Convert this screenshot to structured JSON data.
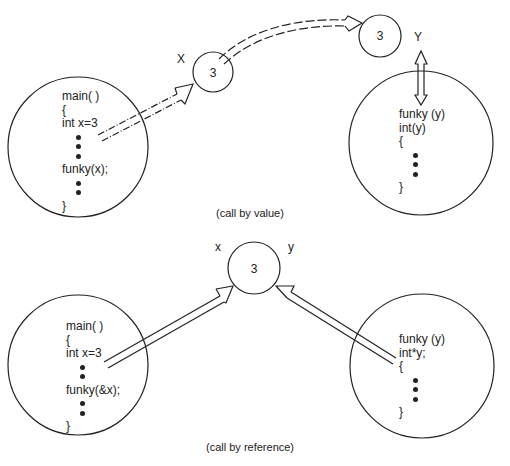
{
  "diagram": {
    "call_by_value": {
      "caption": "(call by value)",
      "caller": {
        "lines": [
          "main( )",
          "{",
          "int x=3",
          "•",
          "•",
          "•",
          "funky(x);",
          "•",
          "•",
          "}"
        ],
        "label_line1": "main( )",
        "label_line2": "{",
        "label_line3": "int x=3",
        "label_line4": "funky(x);",
        "label_line5": "}"
      },
      "x_var": {
        "label": "X",
        "value": "3"
      },
      "y_var": {
        "label": "Y",
        "value": "3"
      },
      "callee": {
        "lines": [
          "funky (y)",
          "int(y)",
          "{",
          "•",
          "•",
          "•",
          "}"
        ],
        "label_line1": "funky (y)",
        "label_line2": "int(y)",
        "label_line3": "{",
        "label_line4": "}"
      }
    },
    "call_by_reference": {
      "caption": "(call by reference)",
      "caller": {
        "lines": [
          "main( )",
          "{",
          "int x=3",
          "•",
          "•",
          "funky(&x);",
          "•",
          "•",
          "}"
        ],
        "label_line1": "main( )",
        "label_line2": "{",
        "label_line3": "int x=3",
        "label_line4": "funky(&x);",
        "label_line5": "}"
      },
      "shared_var": {
        "label_x": "x",
        "label_y": "y",
        "value": "3"
      },
      "callee": {
        "lines": [
          "funky (y)",
          "int*y;",
          "{",
          "•",
          "•",
          "•",
          "}"
        ],
        "label_line1": "funky (y)",
        "label_line2": "int*y;",
        "label_line3": "{",
        "label_line4": "}"
      }
    },
    "colors": {
      "stroke": "#222222",
      "background": "#ffffff"
    }
  }
}
